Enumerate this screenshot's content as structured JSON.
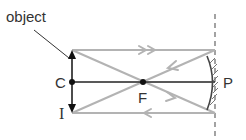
{
  "diagram": {
    "type": "concave-mirror-ray-diagram",
    "labels": {
      "object": "object",
      "center_of_curvature": "C",
      "focus": "F",
      "pole": "P",
      "image": "I"
    },
    "colors": {
      "axis": "#222222",
      "rays": "#b3b3b3",
      "arrows": "#111111",
      "mirror": "#444444",
      "hatch": "#777777",
      "dashed": "#666666",
      "text": "#333333"
    }
  }
}
